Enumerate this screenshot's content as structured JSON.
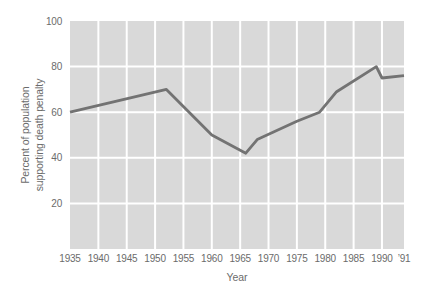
{
  "figure": {
    "background_color": "#ffffff"
  },
  "chart_data": {
    "type": "line",
    "title": "",
    "xlabel": "Year",
    "ylabel": "Percent of population supporting death penalty",
    "ylabel_lines": [
      "Percent of population",
      "supporting death penalty"
    ],
    "xlim": [
      1935,
      1991
    ],
    "ylim": [
      0,
      100
    ],
    "grid": true,
    "legend": "none",
    "x_ticks": [
      {
        "year": 1935,
        "label": "1935"
      },
      {
        "year": 1940,
        "label": "1940"
      },
      {
        "year": 1945,
        "label": "1945"
      },
      {
        "year": 1950,
        "label": "1950"
      },
      {
        "year": 1955,
        "label": "1955"
      },
      {
        "year": 1960,
        "label": "1960"
      },
      {
        "year": 1965,
        "label": "1965"
      },
      {
        "year": 1970,
        "label": "1970"
      },
      {
        "year": 1975,
        "label": "1975"
      },
      {
        "year": 1980,
        "label": "1980"
      },
      {
        "year": 1985,
        "label": "1985"
      },
      {
        "year": 1990,
        "label": "1990"
      },
      {
        "year": 1991,
        "label": "’91"
      }
    ],
    "y_ticks": [
      20,
      40,
      60,
      80,
      100
    ],
    "series": [
      {
        "name": "percent-supporting-death-penalty",
        "points": [
          [
            1935,
            60
          ],
          [
            1952,
            70
          ],
          [
            1960,
            50
          ],
          [
            1966,
            42
          ],
          [
            1968,
            48
          ],
          [
            1975,
            56
          ],
          [
            1979,
            60
          ],
          [
            1982,
            69
          ],
          [
            1989,
            80
          ],
          [
            1990,
            75
          ],
          [
            1991,
            76
          ]
        ]
      }
    ],
    "colors": {
      "plot_background": "#d9d9d9",
      "gridline": "#ffffff",
      "line": "#737373",
      "text": "#6b6b6b"
    }
  }
}
